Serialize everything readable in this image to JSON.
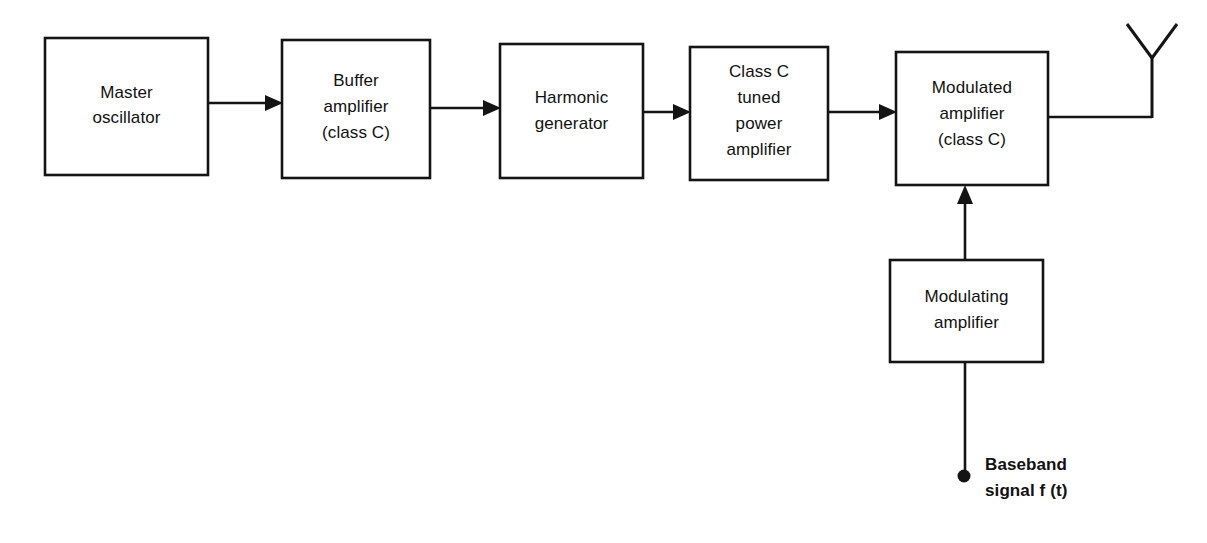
{
  "diagram": {
    "background_color": "#ffffff",
    "line_color": "#141414",
    "text_color": "#111111",
    "blocks": [
      {
        "id": "master-oscillator",
        "lines": [
          "Master",
          "oscillator"
        ],
        "line1": "Master",
        "line2": "oscillator",
        "x": 45,
        "y": 38,
        "w": 163,
        "h": 137
      },
      {
        "id": "buffer-amplifier",
        "lines": [
          "Buffer",
          "amplifier",
          "(class C)"
        ],
        "line1": "Buffer",
        "line2": "amplifier",
        "line3": "(class C)",
        "x": 282,
        "y": 40,
        "w": 148,
        "h": 138
      },
      {
        "id": "harmonic-generator",
        "lines": [
          "Harmonic",
          "generator"
        ],
        "line1": "Harmonic",
        "line2": "generator",
        "x": 500,
        "y": 44,
        "w": 143,
        "h": 134
      },
      {
        "id": "class-c-tuned-power-amplifier",
        "lines": [
          "Class C",
          "tuned",
          "power",
          "amplifier"
        ],
        "line1": "Class C",
        "line2": "tuned",
        "line3": "power",
        "line4": "amplifier",
        "x": 690,
        "y": 47,
        "w": 138,
        "h": 133
      },
      {
        "id": "modulated-amplifier",
        "lines": [
          "Modulated",
          "amplifier",
          "(class C)"
        ],
        "line1": "Modulated",
        "line2": "amplifier",
        "line3": "(class C)",
        "x": 896,
        "y": 52,
        "w": 152,
        "h": 133
      },
      {
        "id": "modulating-amplifier",
        "lines": [
          "Modulating",
          "amplifier"
        ],
        "line1": "Modulating",
        "line2": "amplifier",
        "x": 890,
        "y": 260,
        "w": 153,
        "h": 102
      }
    ],
    "input_terminal": {
      "id": "baseband-input",
      "line1": "Baseband",
      "line2": "signal f (t)",
      "dot_x": 964,
      "dot_y": 476,
      "dot_r": 6.5,
      "label_x": 985
    },
    "antenna": {
      "id": "antenna",
      "mast_x": 1152,
      "mast_top": 57,
      "mast_bottom": 117,
      "arm_left_x": 1126,
      "arm_right_x": 1178,
      "arm_top_y": 24
    },
    "connections": [
      {
        "id": "osc-to-buffer",
        "from": "master-oscillator",
        "to": "buffer-amplifier",
        "x1": 208,
        "x2": 282,
        "y": 103,
        "arrow": true
      },
      {
        "id": "buffer-to-harmonic",
        "from": "buffer-amplifier",
        "to": "harmonic-generator",
        "x1": 430,
        "x2": 500,
        "y": 108,
        "arrow": true
      },
      {
        "id": "harmonic-to-classc",
        "from": "harmonic-generator",
        "to": "class-c-tuned-power-amplifier",
        "x1": 643,
        "x2": 690,
        "y": 112,
        "arrow": true
      },
      {
        "id": "classc-to-modulated",
        "from": "class-c-tuned-power-amplifier",
        "to": "modulated-amplifier",
        "x1": 828,
        "x2": 896,
        "y": 112,
        "arrow": true
      },
      {
        "id": "modulated-to-antenna",
        "from": "modulated-amplifier",
        "to": "antenna",
        "x1": 1048,
        "x2": 1152,
        "y": 117,
        "arrow": false
      },
      {
        "id": "modulating-to-modulated",
        "from": "modulating-amplifier",
        "to": "modulated-amplifier",
        "x": 965,
        "y1": 260,
        "y2": 185,
        "arrow": true
      },
      {
        "id": "baseband-to-modulating",
        "from": "baseband-input",
        "to": "modulating-amplifier",
        "x": 965,
        "y1": 476,
        "y2": 362,
        "arrow": false
      }
    ]
  }
}
